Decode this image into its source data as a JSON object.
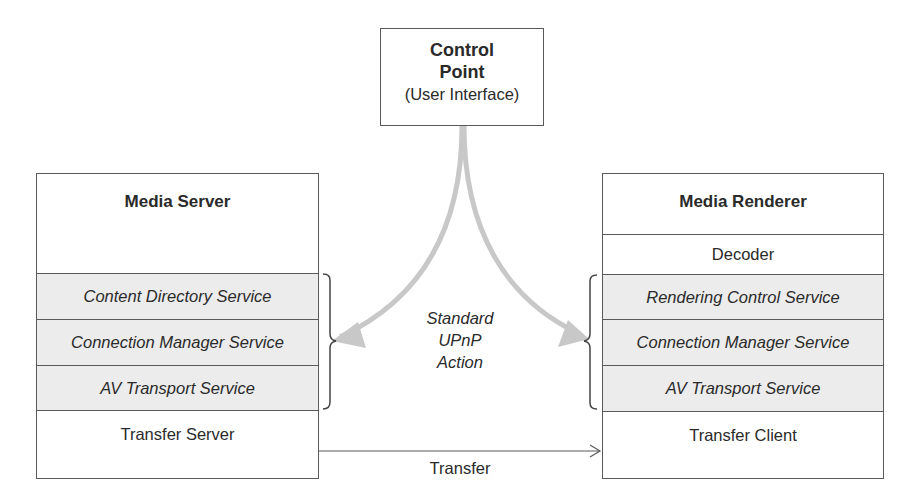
{
  "control_point": {
    "title": "Control Point",
    "subtitle": "(User Interface)"
  },
  "media_server": {
    "title": "Media Server",
    "services": [
      "Content Directory Service",
      "Connection Manager Service",
      "AV Transport Service"
    ],
    "transfer": "Transfer Server"
  },
  "media_renderer": {
    "title": "Media Renderer",
    "decoder": "Decoder",
    "services": [
      "Rendering Control Service",
      "Connection Manager Service",
      "AV Transport Service"
    ],
    "transfer": "Transfer Client"
  },
  "action_label": {
    "line1": "Standard",
    "line2": "UPnP",
    "line3": "Action"
  },
  "transfer_label": "Transfer",
  "colors": {
    "line": "#5a5a5a",
    "arrow": "#c8c8c8",
    "service_fill": "#ececec"
  }
}
